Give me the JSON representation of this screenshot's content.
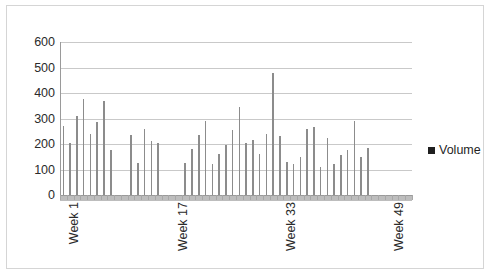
{
  "chart_data": {
    "type": "bar",
    "title": "",
    "xlabel": "",
    "ylabel": "",
    "ylim": [
      0,
      600
    ],
    "ytick_values": [
      0,
      100,
      200,
      300,
      400,
      500,
      600
    ],
    "ytick_labels": [
      "0",
      "100",
      "200",
      "300",
      "400",
      "500",
      "600"
    ],
    "grid": true,
    "legend_position": "right",
    "bar_color": "#8c8c8c",
    "legend_swatch_color": "#1f1f1f",
    "series": [
      {
        "name": "Volume",
        "categories": [
          "Week 1",
          "Week 2",
          "Week 3",
          "Week 4",
          "Week 5",
          "Week 6",
          "Week 7",
          "Week 8",
          "Week 9",
          "Week 10",
          "Week 11",
          "Week 12",
          "Week 13",
          "Week 14",
          "Week 15",
          "Week 16",
          "Week 17",
          "Week 18",
          "Week 19",
          "Week 20",
          "Week 21",
          "Week 22",
          "Week 23",
          "Week 24",
          "Week 25",
          "Week 26",
          "Week 27",
          "Week 28",
          "Week 29",
          "Week 30",
          "Week 31",
          "Week 32",
          "Week 33",
          "Week 34",
          "Week 35",
          "Week 36",
          "Week 37",
          "Week 38",
          "Week 39",
          "Week 40",
          "Week 41",
          "Week 42",
          "Week 43",
          "Week 44",
          "Week 45",
          "Week 46",
          "Week 47",
          "Week 48",
          "Week 49",
          "Week 50",
          "Week 51",
          "Week 52"
        ],
        "values": [
          270,
          205,
          310,
          375,
          240,
          285,
          370,
          175,
          0,
          0,
          235,
          125,
          260,
          210,
          205,
          0,
          0,
          0,
          125,
          180,
          235,
          290,
          120,
          160,
          195,
          255,
          345,
          205,
          215,
          160,
          240,
          480,
          230,
          130,
          120,
          150,
          260,
          265,
          110,
          225,
          120,
          155,
          175,
          290,
          150,
          185,
          0,
          0,
          0,
          0,
          0,
          0
        ]
      }
    ],
    "visible_xtick_labels": [
      {
        "index": 0,
        "label": "Week 1"
      },
      {
        "index": 16,
        "label": "Week 17"
      },
      {
        "index": 32,
        "label": "Week 33"
      },
      {
        "index": 48,
        "label": "Week 49"
      }
    ]
  },
  "legend": {
    "entry_label": "Volume"
  }
}
